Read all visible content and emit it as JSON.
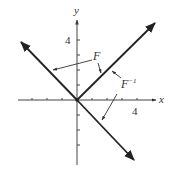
{
  "diagram": {
    "axes": {
      "x_label": "x",
      "y_label": "y",
      "x_tick_label": "4",
      "y_tick_label": "4",
      "unit_px": 15,
      "origin_px": [
        77,
        100
      ]
    },
    "curves": {
      "F_label": "F",
      "F_inverse_label_base": "F",
      "F_inverse_label_sup": "−1"
    },
    "colors": {
      "line": "#222222",
      "axis": "#444444",
      "text": "#333333",
      "background": "#ffffff"
    }
  }
}
